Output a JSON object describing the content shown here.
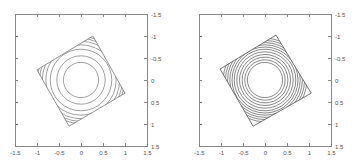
{
  "chart_data": [
    {
      "type": "contour",
      "title": "",
      "xlabel": "",
      "ylabel": "",
      "xlim": [
        -1.5,
        1.5
      ],
      "ylim": [
        -1.5,
        1.5
      ],
      "y_axis_inverted": true,
      "y_axis_position": "right",
      "grid": false,
      "x_ticks": [
        "-1.5",
        "-1",
        "-0.5",
        "0",
        "0.5",
        "1",
        "1.5"
      ],
      "y_ticks": [
        "-1.5",
        "-1",
        "-0.5",
        "0",
        "0.5",
        "1",
        "1.5"
      ],
      "boundary_square_corners": [
        [
          0.27,
          -1.0
        ],
        [
          1.0,
          0.3
        ],
        [
          -0.27,
          1.05
        ],
        [
          -1.0,
          -0.23
        ]
      ],
      "contour_radii": [
        0.4,
        0.55,
        0.7,
        0.8,
        0.88,
        0.94,
        0.99
      ],
      "line_color": "#777777"
    },
    {
      "type": "contour",
      "title": "",
      "xlabel": "",
      "ylabel": "",
      "xlim": [
        -1.5,
        1.5
      ],
      "ylim": [
        -1.5,
        1.5
      ],
      "y_axis_inverted": true,
      "y_axis_position": "right",
      "grid": false,
      "x_ticks": [
        "-1.5",
        "-1",
        "-0.5",
        "0",
        "0.5",
        "1",
        "1.5"
      ],
      "y_ticks": [
        "-1.5",
        "-1",
        "-0.5",
        "0",
        "0.5",
        "1",
        "1.5"
      ],
      "boundary_square_corners": [
        [
          0.25,
          -1.02
        ],
        [
          1.05,
          0.3
        ],
        [
          -0.27,
          1.05
        ],
        [
          -1.02,
          -0.25
        ]
      ],
      "contour_radii": [
        0.4,
        0.46,
        0.52,
        0.58,
        0.64,
        0.7,
        0.75,
        0.8,
        0.85,
        0.9,
        0.95
      ],
      "line_color": "#555555"
    }
  ],
  "panels": [
    {
      "x_ticks": [
        "-1.5",
        "-1",
        "-0.5",
        "0",
        "0.5",
        "1",
        "1.5"
      ],
      "y_ticks": [
        "-1.5",
        "-1",
        "-0.5",
        "0",
        "0.5",
        "1",
        "1.5"
      ]
    },
    {
      "x_ticks": [
        "-1.5",
        "-1",
        "-0.5",
        "0",
        "0.5",
        "1",
        "1.5"
      ],
      "y_ticks": [
        "-1.5",
        "-1",
        "-0.5",
        "0",
        "0.5",
        "1",
        "1.5"
      ]
    }
  ]
}
